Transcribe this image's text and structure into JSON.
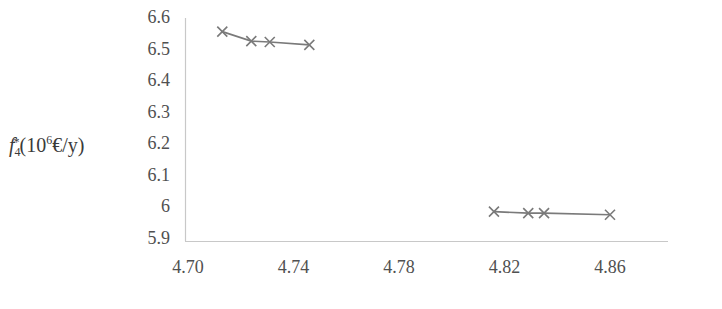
{
  "chart_data": {
    "type": "line",
    "title": "",
    "xlabel": "",
    "ylabel": "f4*(10^6€/y)",
    "ylabel_parts": {
      "var": "f",
      "sub": "4",
      "sup": "*",
      "unit_open": "(10",
      "unit_exp": "6",
      "unit_rest": "€/y)"
    },
    "xlim": [
      4.7,
      4.88
    ],
    "ylim": [
      5.9,
      6.6
    ],
    "x_ticks": [
      "4.70",
      "4.74",
      "4.78",
      "4.82",
      "4.86"
    ],
    "y_ticks": [
      "6.6",
      "6.5",
      "6.4",
      "6.3",
      "6.2",
      "6.1",
      "6",
      "5.9"
    ],
    "grid": false,
    "legend": null,
    "marker": "x",
    "line_color": "#7a7a7a",
    "series": [
      {
        "name": "upper-cluster",
        "x": [
          4.713,
          4.724,
          4.731,
          4.746
        ],
        "y": [
          6.56,
          6.53,
          6.527,
          6.518
        ]
      },
      {
        "name": "lower-cluster",
        "x": [
          4.816,
          4.829,
          4.835,
          4.86
        ],
        "y": [
          5.99,
          5.985,
          5.985,
          5.98
        ]
      }
    ]
  }
}
